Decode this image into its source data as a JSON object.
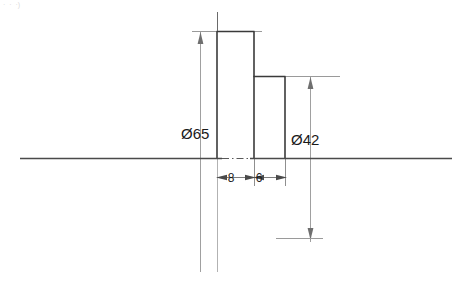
{
  "drawing": {
    "title": "stepped-shaft-section-view",
    "corner_mark": "·  ·  ·)",
    "colors": {
      "outline": "#3a3a3a",
      "axis": "#4a4a4a",
      "dimension": "#8a8a8a",
      "text": "#1a1a1a",
      "background": "#ffffff"
    },
    "dimensions": [
      {
        "id": "diameter-65",
        "label": "Ø65",
        "value": 65,
        "symbol": "Ø",
        "orientation": "vertical",
        "label_x": 181,
        "label_y": 139
      },
      {
        "id": "diameter-42",
        "label": "Ø42",
        "value": 42,
        "symbol": "Ø",
        "orientation": "vertical",
        "label_x": 291,
        "label_y": 145
      },
      {
        "id": "width-8",
        "label": "8",
        "value": 8,
        "orientation": "horizontal",
        "label_x": 231,
        "label_y": 182
      },
      {
        "id": "width-6",
        "label": "6",
        "value": 6,
        "orientation": "horizontal",
        "label_x": 259,
        "label_y": 182
      }
    ],
    "geometry": {
      "axis_line": {
        "x1": 20,
        "y1": 158,
        "x2": 452,
        "y2": 158
      },
      "centerline": {
        "x": 217,
        "y1": 12,
        "y2": 272
      },
      "tall_step": {
        "x1": 217,
        "y1": 31,
        "x2": 254,
        "y2": 158
      },
      "short_step": {
        "x1": 254,
        "y1": 76,
        "x2": 285,
        "y2": 158
      }
    }
  }
}
